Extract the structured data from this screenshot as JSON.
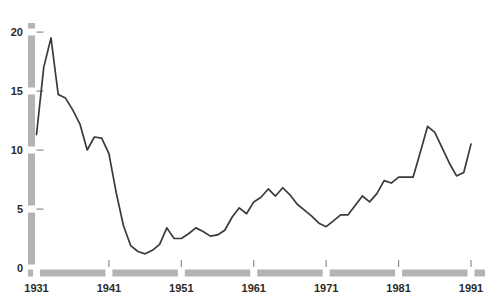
{
  "chart_data": {
    "type": "line",
    "title": "",
    "subtitle": "",
    "xlabel": "",
    "ylabel": "",
    "grid": false,
    "legend": "none",
    "xlim": [
      1931,
      1991
    ],
    "ylim": [
      0,
      21
    ],
    "xticks": [
      1931,
      1941,
      1951,
      1961,
      1971,
      1981,
      1991
    ],
    "xticklabels": [
      "1931",
      "1941",
      "1951",
      "1961",
      "1971",
      "1981",
      "1991"
    ],
    "yticks": [
      0,
      5,
      10,
      15,
      20
    ],
    "yticklabels": [
      "0",
      "5",
      "10",
      "15",
      "20"
    ],
    "series": [
      {
        "name": "value",
        "color": "#3a3a3a",
        "x": [
          1931,
          1932,
          1933,
          1934,
          1935,
          1936,
          1937,
          1938,
          1939,
          1940,
          1941,
          1942,
          1943,
          1944,
          1945,
          1946,
          1947,
          1948,
          1949,
          1950,
          1951,
          1952,
          1953,
          1954,
          1955,
          1956,
          1957,
          1958,
          1959,
          1960,
          1961,
          1962,
          1963,
          1964,
          1965,
          1966,
          1967,
          1968,
          1969,
          1970,
          1971,
          1972,
          1973,
          1974,
          1975,
          1976,
          1977,
          1978,
          1979,
          1980,
          1981,
          1982,
          1983,
          1984,
          1985,
          1986,
          1987,
          1988,
          1989,
          1990,
          1991
        ],
        "values": [
          11.3,
          17.0,
          19.5,
          14.7,
          14.4,
          13.4,
          12.2,
          10.0,
          11.1,
          11.0,
          9.7,
          6.4,
          3.6,
          1.9,
          1.4,
          1.2,
          1.5,
          2.0,
          3.4,
          2.5,
          2.5,
          2.9,
          3.4,
          3.1,
          2.7,
          2.8,
          3.2,
          4.3,
          5.1,
          4.6,
          5.6,
          6.0,
          6.7,
          6.1,
          6.8,
          6.2,
          5.4,
          4.9,
          4.4,
          3.8,
          3.5,
          4.0,
          4.5,
          4.5,
          5.3,
          6.1,
          5.6,
          6.3,
          7.4,
          7.2,
          7.7,
          7.7,
          7.7,
          9.8,
          12.0,
          11.5,
          10.2,
          8.9,
          7.8,
          8.1,
          10.5
        ]
      }
    ]
  },
  "axes": {
    "y_axis_name": "y-axis",
    "x_axis_name": "x-axis",
    "axis_color": "#b3b3b3"
  }
}
